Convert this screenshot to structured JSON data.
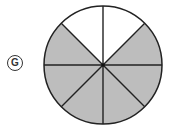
{
  "option_label": "G",
  "figure": {
    "type": "fraction-circle",
    "total_slices": 8,
    "shaded_slices": 6,
    "unshaded_slices": 2,
    "shaded_color": "#bdbdbd",
    "unshaded_color": "#ffffff",
    "stroke_color": "#222222"
  }
}
